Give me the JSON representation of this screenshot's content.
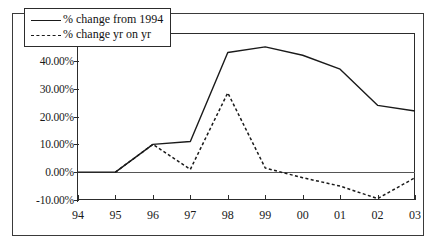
{
  "chart_data": {
    "type": "line",
    "title": "",
    "xlabel": "",
    "ylabel": "",
    "categories": [
      "94",
      "95",
      "96",
      "97",
      "98",
      "99",
      "00",
      "01",
      "02",
      "03"
    ],
    "ylim": [
      -10,
      50
    ],
    "yticks": [
      -10,
      0,
      10,
      20,
      30,
      40,
      50
    ],
    "ytick_labels": [
      "-10.00%",
      "0.00%",
      "10.00%",
      "20.00%",
      "30.00%",
      "40.00%",
      "50.00%"
    ],
    "grid": false,
    "legend_position": "upper-left-inside",
    "series": [
      {
        "name": "% change from 1994",
        "style": "solid",
        "color": "#1a1a1a",
        "values": [
          0,
          0,
          10,
          11,
          43,
          45,
          42,
          37,
          24,
          22
        ]
      },
      {
        "name": "% change yr on yr",
        "style": "dashed",
        "color": "#1a1a1a",
        "values": [
          null,
          0,
          10,
          1,
          28.5,
          1.5,
          -2,
          -5,
          -9.5,
          -2
        ]
      }
    ]
  },
  "legend": {
    "items": [
      {
        "label": "% change from 1994"
      },
      {
        "label": "% change yr on yr"
      }
    ]
  },
  "axis": {
    "y_labels": [
      "50.00%",
      "40.00%",
      "30.00%",
      "20.00%",
      "10.00%",
      "0.00%",
      "-10.00%"
    ],
    "x_labels": [
      "94",
      "95",
      "96",
      "97",
      "98",
      "99",
      "00",
      "01",
      "02",
      "03"
    ]
  }
}
